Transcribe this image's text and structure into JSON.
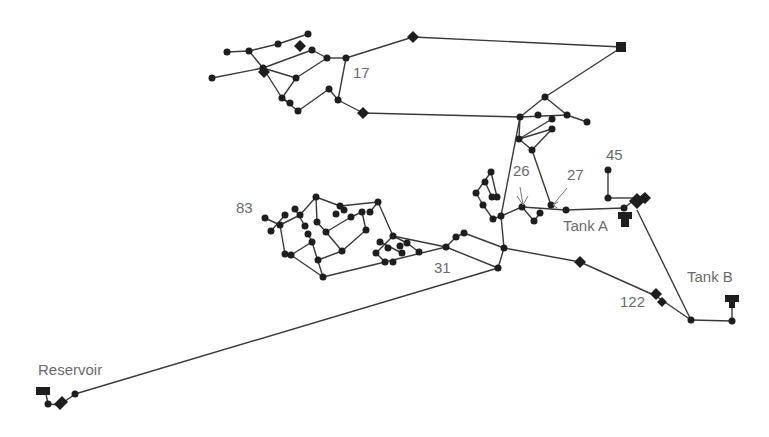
{
  "diagram": {
    "type": "water-distribution-network",
    "labels": [
      {
        "id": "reservoir",
        "text": "Reservoir",
        "x": 38,
        "y": 361
      },
      {
        "id": "tank-a",
        "text": "Tank A",
        "x": 563,
        "y": 217
      },
      {
        "id": "tank-b",
        "text": "Tank B",
        "x": 687,
        "y": 268
      },
      {
        "id": "node-17",
        "text": "17",
        "x": 353,
        "y": 64
      },
      {
        "id": "node-26",
        "text": "26",
        "x": 513,
        "y": 162
      },
      {
        "id": "node-27",
        "text": "27",
        "x": 567,
        "y": 166
      },
      {
        "id": "node-45",
        "text": "45",
        "x": 606,
        "y": 146
      },
      {
        "id": "node-83",
        "text": "83",
        "x": 236,
        "y": 199
      },
      {
        "id": "node-31",
        "text": "31",
        "x": 434,
        "y": 259
      },
      {
        "id": "node-122",
        "text": "122",
        "x": 620,
        "y": 293
      }
    ],
    "colors": {
      "pipe": "#3a3a3a",
      "node": "#1e1e1e",
      "label": "#6b6b6b",
      "background": "#ffffff"
    }
  }
}
